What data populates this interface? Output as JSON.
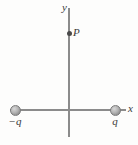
{
  "figure": {
    "width": 138,
    "height": 145,
    "background_color": "#fdfdfc",
    "axis_color": "#8b8b8b",
    "label_color": "#3a3a3a",
    "charge_color": "#b4b4b4",
    "point_color": "#4a4a4a"
  },
  "axes": {
    "y": {
      "label": "y",
      "x_px": 69,
      "top_px": 8,
      "bottom_px": 137
    },
    "x": {
      "label": "x",
      "y_px": 110,
      "left_px": 10,
      "right_px": 126
    }
  },
  "field_point": {
    "label": "P",
    "x_px": 69,
    "y_px": 33
  },
  "charges": [
    {
      "name": "negative-charge",
      "label": "−q",
      "x_px": 15,
      "y_px": 110
    },
    {
      "name": "positive-charge",
      "label": "q",
      "x_px": 115,
      "y_px": 110
    }
  ]
}
